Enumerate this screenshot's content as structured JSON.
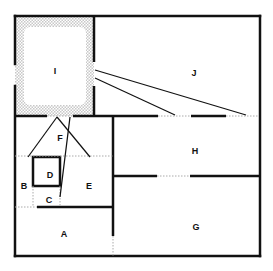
{
  "diagram": {
    "type": "floor-plan",
    "colors": {
      "wall": "#111111",
      "dotted": "#bbbbbb",
      "hatch": "#cccccc",
      "background": "#ffffff"
    },
    "rooms": [
      {
        "id": "I",
        "label": "I",
        "x": 55,
        "y": 71
      },
      {
        "id": "J",
        "label": "J",
        "x": 194,
        "y": 73
      },
      {
        "id": "F",
        "label": "F",
        "x": 60,
        "y": 138
      },
      {
        "id": "H",
        "label": "H",
        "x": 195,
        "y": 151
      },
      {
        "id": "D",
        "label": "D",
        "x": 50,
        "y": 175
      },
      {
        "id": "B",
        "label": "B",
        "x": 24,
        "y": 186
      },
      {
        "id": "E",
        "label": "E",
        "x": 89,
        "y": 186
      },
      {
        "id": "C",
        "label": "C",
        "x": 49,
        "y": 200
      },
      {
        "id": "G",
        "label": "G",
        "x": 196,
        "y": 227
      },
      {
        "id": "A",
        "label": "A",
        "x": 64,
        "y": 234
      }
    ]
  }
}
